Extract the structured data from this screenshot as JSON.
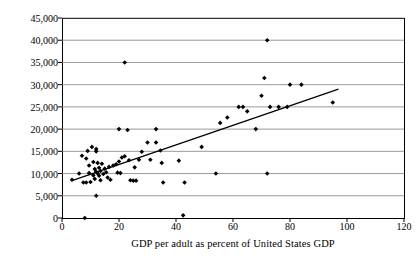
{
  "chart_data": {
    "type": "scatter",
    "title": "",
    "xlabel": "GDP per adult as percent of United States GDP",
    "ylabel": "Median Earnings",
    "xlim": [
      0,
      120
    ],
    "ylim": [
      0,
      45000
    ],
    "xticks": [
      0,
      20,
      40,
      60,
      80,
      100,
      120
    ],
    "xtick_labels": [
      "0",
      "20",
      "40",
      "60",
      "80",
      "100",
      "120"
    ],
    "yticks": [
      0,
      5000,
      10000,
      15000,
      20000,
      25000,
      30000,
      35000,
      40000,
      45000
    ],
    "ytick_labels": [
      "0",
      "5,000",
      "10,000",
      "15,000",
      "20,000",
      "25,000",
      "30,000",
      "35,000",
      "40,000",
      "45,000"
    ],
    "grid": "horizontal",
    "legend": "none",
    "marker": "filled-diamond",
    "marker_color": "#000000",
    "trendline": {
      "label": "linear fit",
      "color": "#000000",
      "x_start": 3.5,
      "y_start": 8400,
      "x_end": 97.0,
      "y_end": 29000
    },
    "points": [
      {
        "x": 3.5,
        "y": 8600
      },
      {
        "x": 6.0,
        "y": 10000
      },
      {
        "x": 7.0,
        "y": 14000
      },
      {
        "x": 7.5,
        "y": 8000
      },
      {
        "x": 8.0,
        "y": 0
      },
      {
        "x": 8.5,
        "y": 13400
      },
      {
        "x": 8.5,
        "y": 8000
      },
      {
        "x": 9.0,
        "y": 15100
      },
      {
        "x": 9.5,
        "y": 11800
      },
      {
        "x": 9.5,
        "y": 10100
      },
      {
        "x": 10.0,
        "y": 8100
      },
      {
        "x": 10.5,
        "y": 16000
      },
      {
        "x": 11.0,
        "y": 12600
      },
      {
        "x": 11.0,
        "y": 9600
      },
      {
        "x": 11.5,
        "y": 11000
      },
      {
        "x": 11.5,
        "y": 8800
      },
      {
        "x": 12.0,
        "y": 15500
      },
      {
        "x": 12.0,
        "y": 15000
      },
      {
        "x": 12.0,
        "y": 10400
      },
      {
        "x": 12.0,
        "y": 5000
      },
      {
        "x": 12.5,
        "y": 12400
      },
      {
        "x": 12.5,
        "y": 10000
      },
      {
        "x": 13.0,
        "y": 11300
      },
      {
        "x": 13.0,
        "y": 9500
      },
      {
        "x": 13.5,
        "y": 10600
      },
      {
        "x": 13.5,
        "y": 8500
      },
      {
        "x": 14.0,
        "y": 12200
      },
      {
        "x": 14.5,
        "y": 9900
      },
      {
        "x": 15.0,
        "y": 11100
      },
      {
        "x": 15.5,
        "y": 10300
      },
      {
        "x": 16.0,
        "y": 9100
      },
      {
        "x": 16.5,
        "y": 11500
      },
      {
        "x": 17.0,
        "y": 8600
      },
      {
        "x": 18.0,
        "y": 11800
      },
      {
        "x": 19.0,
        "y": 12100
      },
      {
        "x": 19.5,
        "y": 10200
      },
      {
        "x": 20.0,
        "y": 20000
      },
      {
        "x": 20.0,
        "y": 12700
      },
      {
        "x": 20.5,
        "y": 10100
      },
      {
        "x": 21.0,
        "y": 13600
      },
      {
        "x": 22.0,
        "y": 35000
      },
      {
        "x": 22.0,
        "y": 13900
      },
      {
        "x": 23.0,
        "y": 19800
      },
      {
        "x": 23.5,
        "y": 13000
      },
      {
        "x": 24.0,
        "y": 8500
      },
      {
        "x": 25.0,
        "y": 8400
      },
      {
        "x": 25.5,
        "y": 11400
      },
      {
        "x": 26.0,
        "y": 8400
      },
      {
        "x": 27.0,
        "y": 13100
      },
      {
        "x": 28.0,
        "y": 14900
      },
      {
        "x": 30.0,
        "y": 17000
      },
      {
        "x": 31.0,
        "y": 13100
      },
      {
        "x": 33.0,
        "y": 20000
      },
      {
        "x": 33.0,
        "y": 17000
      },
      {
        "x": 34.5,
        "y": 15200
      },
      {
        "x": 35.0,
        "y": 12400
      },
      {
        "x": 35.5,
        "y": 8000
      },
      {
        "x": 41.0,
        "y": 12900
      },
      {
        "x": 42.5,
        "y": 600
      },
      {
        "x": 43.0,
        "y": 8000
      },
      {
        "x": 49.0,
        "y": 16000
      },
      {
        "x": 54.0,
        "y": 10000
      },
      {
        "x": 55.5,
        "y": 21400
      },
      {
        "x": 58.0,
        "y": 22600
      },
      {
        "x": 62.0,
        "y": 25000
      },
      {
        "x": 63.5,
        "y": 25000
      },
      {
        "x": 65.0,
        "y": 24000
      },
      {
        "x": 68.0,
        "y": 20000
      },
      {
        "x": 70.0,
        "y": 27500
      },
      {
        "x": 71.0,
        "y": 31500
      },
      {
        "x": 72.0,
        "y": 40000
      },
      {
        "x": 72.0,
        "y": 10000
      },
      {
        "x": 73.0,
        "y": 25000
      },
      {
        "x": 76.0,
        "y": 25000
      },
      {
        "x": 79.0,
        "y": 25000
      },
      {
        "x": 80.0,
        "y": 30000
      },
      {
        "x": 84.0,
        "y": 30000
      },
      {
        "x": 95.0,
        "y": 26000
      }
    ]
  }
}
